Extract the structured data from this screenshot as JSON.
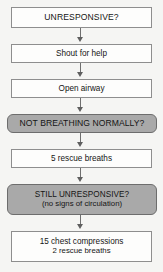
{
  "diagram": {
    "background_color": "#f5f5f3",
    "decision_fill": "#a9a9a9",
    "action_fill": "#fdfdfc",
    "border_color": "#8e8e8e",
    "connector_color": "#6f6f6f",
    "nodes": [
      {
        "id": "unresponsive",
        "kind": "decision-plain",
        "label": "UNRESPONSIVE?"
      },
      {
        "id": "shout-for-help",
        "kind": "action",
        "label": "Shout for help"
      },
      {
        "id": "open-airway",
        "kind": "action",
        "label": "Open airway"
      },
      {
        "id": "not-breathing-normally",
        "kind": "decision",
        "label": "NOT BREATHING NORMALLY?"
      },
      {
        "id": "five-rescue-breaths",
        "kind": "action",
        "label": "5 rescue breaths"
      },
      {
        "id": "still-unresponsive",
        "kind": "decision",
        "label": "STILL UNRESPONSIVE?",
        "sublabel": "(no signs of circulation)"
      },
      {
        "id": "compressions-and-breaths",
        "kind": "action",
        "label": "15 chest compressions",
        "sublabel": "2 rescue breaths"
      }
    ]
  }
}
